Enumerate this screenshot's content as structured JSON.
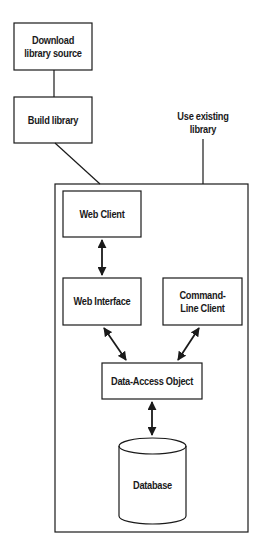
{
  "diagram": {
    "nodes": {
      "download": {
        "label": "Download library source"
      },
      "build": {
        "label": "Build library"
      },
      "use_existing": {
        "label": "Use existing library"
      },
      "web_client": {
        "label": "Web Client"
      },
      "web_interface": {
        "label": "Web Interface"
      },
      "cli": {
        "label": "Command-Line Client"
      },
      "dao": {
        "label": "Data-Access Object"
      },
      "database": {
        "label": "Database"
      }
    },
    "edges": [
      {
        "from": "download",
        "to": "build",
        "type": "line"
      },
      {
        "from": "build",
        "to": "application-container",
        "type": "line"
      },
      {
        "from": "use_existing",
        "to": "application-container",
        "type": "line"
      },
      {
        "from": "web_client",
        "to": "web_interface",
        "type": "bidirectional-arrow"
      },
      {
        "from": "web_interface",
        "to": "dao",
        "type": "bidirectional-arrow"
      },
      {
        "from": "cli",
        "to": "dao",
        "type": "bidirectional-arrow"
      },
      {
        "from": "dao",
        "to": "database",
        "type": "bidirectional-arrow"
      }
    ],
    "colors": {
      "stroke": "#1a1a1a",
      "background": "#ffffff"
    }
  }
}
